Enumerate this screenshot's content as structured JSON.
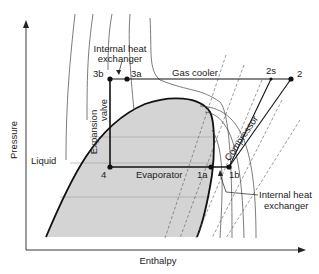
{
  "diagram": {
    "axes": {
      "x_label": "Enthalpy",
      "y_label": "Pressure"
    },
    "regions": {
      "liquid": "Liquid"
    },
    "components": {
      "gas_cooler": "Gas cooler",
      "evaporator": "Evaporator",
      "compressor": "Compressor",
      "expansion_valve_line1": "Expansion",
      "expansion_valve_line2": "valve",
      "ihx_top_line1": "Internal heat",
      "ihx_top_line2": "exchanger",
      "ihx_bottom_line1": "Internal heat",
      "ihx_bottom_line2": "exchanger"
    },
    "states": {
      "s2": "2",
      "s2s": "2s",
      "s3a": "3a",
      "s3b": "3b",
      "s4": "4",
      "s1a": "1a",
      "s1b": "1b"
    },
    "colors": {
      "dome_fill": "#d4d4d4",
      "line": "#1a1a1a",
      "thin_line": "#444444"
    }
  }
}
